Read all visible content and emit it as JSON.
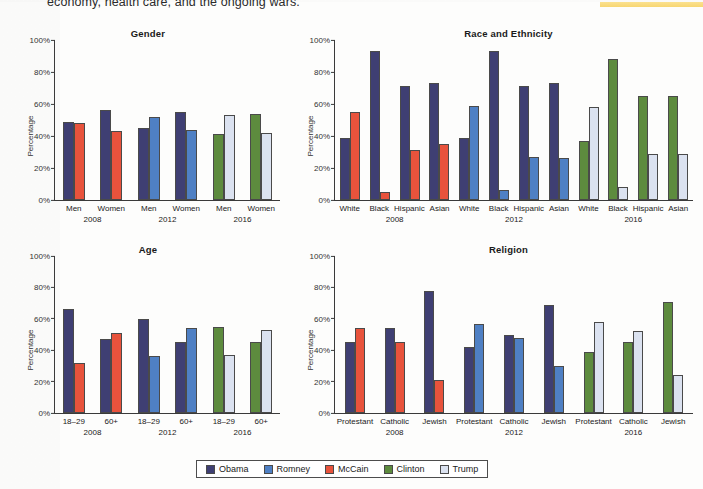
{
  "page": {
    "top_text": "economy, health care, and the ongoing wars.",
    "highlight_color": "#f7d46a"
  },
  "axis": {
    "ylabel": "Percentage",
    "yticks": [
      "100%",
      "80%",
      "60%",
      "40%",
      "20%",
      "0%"
    ],
    "ymin": 0,
    "ymax": 100
  },
  "legend": {
    "items": [
      {
        "label": "Obama",
        "color": "#3f3f73",
        "key": "obama"
      },
      {
        "label": "Romney",
        "color": "#4f80c4",
        "key": "romney"
      },
      {
        "label": "McCain",
        "color": "#e8533c",
        "key": "mccain"
      },
      {
        "label": "Clinton",
        "color": "#5d8b3e",
        "key": "clinton"
      },
      {
        "label": "Trump",
        "color": "#dbe2f0",
        "key": "trump"
      }
    ]
  },
  "chart_data": [
    {
      "type": "bar",
      "title": "Gender",
      "xlabel": "",
      "ylabel": "Percentage",
      "ylim": [
        0,
        100
      ],
      "grid": false,
      "legend_position": "bottom",
      "groups": [
        {
          "year": "2008",
          "categories": [
            "Men",
            "Women"
          ],
          "series": [
            {
              "name": "Obama",
              "key": "obama",
              "values": [
                49,
                56
              ]
            },
            {
              "name": "McCain",
              "key": "mccain",
              "values": [
                48,
                43
              ]
            }
          ]
        },
        {
          "year": "2012",
          "categories": [
            "Men",
            "Women"
          ],
          "series": [
            {
              "name": "Obama",
              "key": "obama",
              "values": [
                45,
                55
              ]
            },
            {
              "name": "Romney",
              "key": "romney",
              "values": [
                52,
                44
              ]
            }
          ]
        },
        {
          "year": "2016",
          "categories": [
            "Men",
            "Women"
          ],
          "series": [
            {
              "name": "Clinton",
              "key": "clinton",
              "values": [
                41,
                54
              ]
            },
            {
              "name": "Trump",
              "key": "trump",
              "values": [
                53,
                42
              ]
            }
          ]
        }
      ]
    },
    {
      "type": "bar",
      "title": "Race and Ethnicity",
      "xlabel": "",
      "ylabel": "Percentage",
      "ylim": [
        0,
        100
      ],
      "grid": false,
      "legend_position": "bottom",
      "groups": [
        {
          "year": "2008",
          "categories": [
            "White",
            "Black",
            "Hispanic",
            "Asian"
          ],
          "series": [
            {
              "name": "Obama",
              "key": "obama",
              "values": [
                39,
                93,
                71,
                73
              ]
            },
            {
              "name": "McCain",
              "key": "mccain",
              "values": [
                55,
                5,
                31,
                35
              ]
            }
          ]
        },
        {
          "year": "2012",
          "categories": [
            "White",
            "Black",
            "Hispanic",
            "Asian"
          ],
          "series": [
            {
              "name": "Obama",
              "key": "obama",
              "values": [
                39,
                93,
                71,
                73
              ]
            },
            {
              "name": "Romney",
              "key": "romney",
              "values": [
                59,
                6,
                27,
                26
              ]
            }
          ]
        },
        {
          "year": "2016",
          "categories": [
            "White",
            "Black",
            "Hispanic",
            "Asian"
          ],
          "series": [
            {
              "name": "Clinton",
              "key": "clinton",
              "values": [
                37,
                88,
                65,
                65
              ]
            },
            {
              "name": "Trump",
              "key": "trump",
              "values": [
                58,
                8,
                29,
                29
              ]
            }
          ]
        }
      ]
    },
    {
      "type": "bar",
      "title": "Age",
      "xlabel": "",
      "ylabel": "Percentage",
      "ylim": [
        0,
        100
      ],
      "grid": false,
      "legend_position": "bottom",
      "groups": [
        {
          "year": "2008",
          "categories": [
            "18–29",
            "60+"
          ],
          "series": [
            {
              "name": "Obama",
              "key": "obama",
              "values": [
                66,
                47
              ]
            },
            {
              "name": "McCain",
              "key": "mccain",
              "values": [
                32,
                51
              ]
            }
          ]
        },
        {
          "year": "2012",
          "categories": [
            "18–29",
            "60+"
          ],
          "series": [
            {
              "name": "Obama",
              "key": "obama",
              "values": [
                60,
                45
              ]
            },
            {
              "name": "Romney",
              "key": "romney",
              "values": [
                36,
                54
              ]
            }
          ]
        },
        {
          "year": "2016",
          "categories": [
            "18–29",
            "60+"
          ],
          "series": [
            {
              "name": "Clinton",
              "key": "clinton",
              "values": [
                55,
                45
              ]
            },
            {
              "name": "Trump",
              "key": "trump",
              "values": [
                37,
                53
              ]
            }
          ]
        }
      ]
    },
    {
      "type": "bar",
      "title": "Religion",
      "xlabel": "",
      "ylabel": "Percentage",
      "ylim": [
        0,
        100
      ],
      "grid": false,
      "legend_position": "bottom",
      "groups": [
        {
          "year": "2008",
          "categories": [
            "Protestant",
            "Catholic",
            "Jewish"
          ],
          "series": [
            {
              "name": "Obama",
              "key": "obama",
              "values": [
                45,
                54,
                78
              ]
            },
            {
              "name": "McCain",
              "key": "mccain",
              "values": [
                54,
                45,
                21
              ]
            }
          ]
        },
        {
          "year": "2012",
          "categories": [
            "Protestant",
            "Catholic",
            "Jewish"
          ],
          "series": [
            {
              "name": "Obama",
              "key": "obama",
              "values": [
                42,
                50,
                69
              ]
            },
            {
              "name": "Romney",
              "key": "romney",
              "values": [
                57,
                48,
                30
              ]
            }
          ]
        },
        {
          "year": "2016",
          "categories": [
            "Protestant",
            "Catholic",
            "Jewish"
          ],
          "series": [
            {
              "name": "Clinton",
              "key": "clinton",
              "values": [
                39,
                45,
                71
              ]
            },
            {
              "name": "Trump",
              "key": "trump",
              "values": [
                58,
                52,
                24
              ]
            }
          ]
        }
      ]
    }
  ]
}
